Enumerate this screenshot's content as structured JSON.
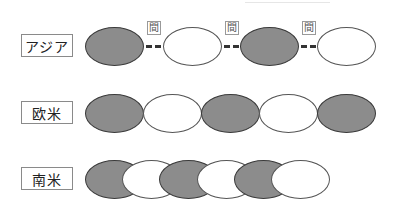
{
  "rows": [
    {
      "label": "アジア",
      "pattern": "gap",
      "ellipses": [
        "gray",
        "white",
        "gray",
        "white"
      ],
      "gap_label": "間"
    },
    {
      "label": "欧米",
      "pattern": "contiguous",
      "ellipses": [
        "gray",
        "white",
        "gray",
        "white",
        "gray"
      ]
    },
    {
      "label": "南米",
      "pattern": "overlapping",
      "ellipses": [
        "gray",
        "white",
        "gray",
        "white",
        "gray",
        "white"
      ]
    }
  ],
  "gap_labels": [
    "間",
    "間",
    "間"
  ],
  "colors": {
    "gray": "#8c8c8c",
    "white": "#ffffff",
    "outline": "#3a3a3a"
  }
}
